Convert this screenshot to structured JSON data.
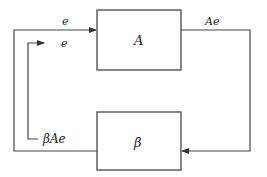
{
  "diagram": {
    "type": "feedback-loop-block-diagram",
    "blocks": [
      {
        "id": "A",
        "label": "A"
      },
      {
        "id": "beta",
        "label": "β"
      }
    ],
    "signals": {
      "input_top": "e",
      "input_inner": "e",
      "forward_output": "Ae",
      "feedback": "βAe"
    },
    "colors": {
      "line": "#444444",
      "box_border": "#555555",
      "background": "#ffffff",
      "text": "#222222"
    }
  }
}
